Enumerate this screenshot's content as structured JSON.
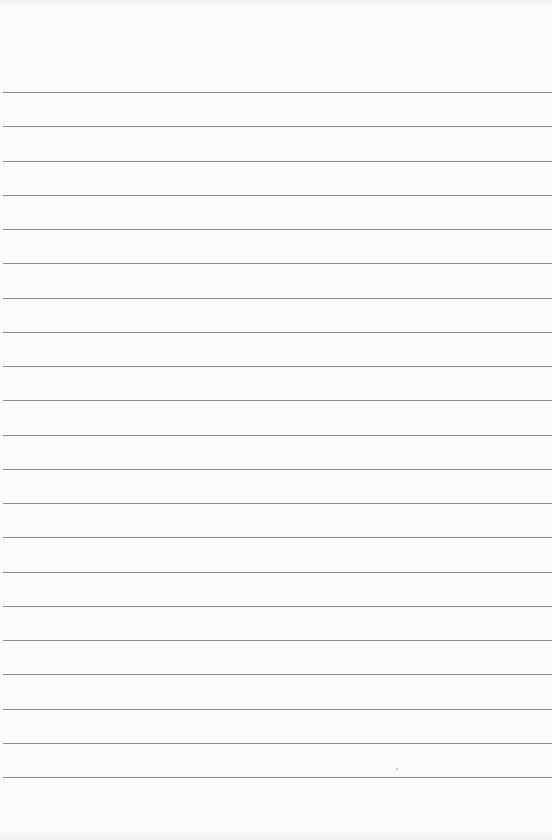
{
  "page": {
    "type": "ruled-paper",
    "background_color": "#fbfbfa",
    "rule_color": "#8c8c8c",
    "rule_count": 21,
    "first_rule_y": 92,
    "rule_spacing": 34.25,
    "content_text": ""
  }
}
